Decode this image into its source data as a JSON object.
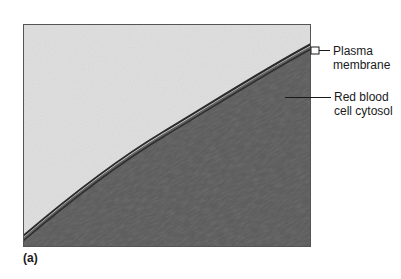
{
  "figure": {
    "panel_label": "(a)",
    "annotations": [
      {
        "line1": "Plasma",
        "line2": "membrane"
      },
      {
        "line1": "Red blood",
        "line2": "cell cytosol"
      }
    ],
    "colors": {
      "extracellular": "#d6d6d6",
      "cytosol": "#5c5c5c",
      "membrane": "#2a2a2a",
      "leader_line": "#1a1a1a"
    }
  }
}
